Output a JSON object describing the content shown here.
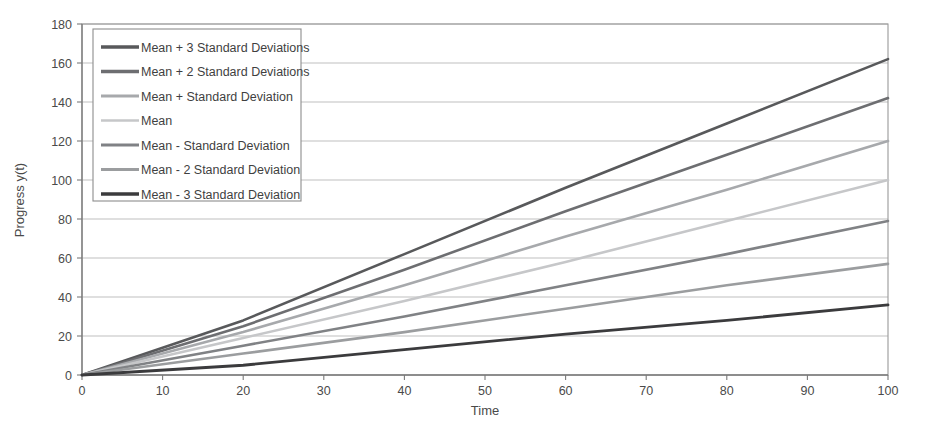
{
  "chart_data": {
    "type": "line",
    "title": "",
    "subtitle": "",
    "xlabel": "Time",
    "ylabel": "Progress y(t)",
    "xlim": [
      0,
      100
    ],
    "ylim": [
      0,
      180
    ],
    "xticks": [
      0,
      10,
      20,
      30,
      40,
      50,
      60,
      70,
      80,
      90,
      100
    ],
    "yticks": [
      0,
      20,
      40,
      60,
      80,
      100,
      120,
      140,
      160,
      180
    ],
    "grid": "horizontal",
    "legend_position": "upper-left-inside",
    "x": [
      0,
      20,
      40,
      60,
      80,
      100
    ],
    "series": [
      {
        "name": "Mean + 3 Standard Deviations",
        "color": "#58595b",
        "width": 2.6,
        "values": [
          0,
          28,
          62,
          96,
          129,
          162
        ]
      },
      {
        "name": "Mean + 2 Standard Deviations",
        "color": "#6d6e71",
        "width": 2.6,
        "values": [
          0,
          25,
          54,
          84,
          113,
          142
        ]
      },
      {
        "name": "Mean + Standard Deviation",
        "color": "#a7a9ac",
        "width": 2.6,
        "values": [
          0,
          22,
          46,
          71,
          95,
          120
        ]
      },
      {
        "name": "Mean",
        "color": "#c6c7c9",
        "width": 2.6,
        "values": [
          0,
          19,
          38,
          58,
          79,
          100
        ]
      },
      {
        "name": "Mean - Standard Deviation",
        "color": "#808285",
        "width": 2.6,
        "values": [
          0,
          15,
          30,
          46,
          62,
          79
        ]
      },
      {
        "name": "Mean - 2 Standard Deviation",
        "color": "#9b9d9f",
        "width": 2.6,
        "values": [
          0,
          11,
          22,
          34,
          46,
          57
        ]
      },
      {
        "name": "Mean - 3 Standard Deviation",
        "color": "#3b3b3d",
        "width": 2.8,
        "values": [
          0,
          5,
          13,
          21,
          28,
          36
        ]
      }
    ]
  },
  "legend": {
    "items": [
      {
        "label": "Mean + 3 Standard Deviations",
        "color": "#58595b",
        "width": 3.4
      },
      {
        "label": "Mean + 2 Standard Deviations",
        "color": "#6d6e71",
        "width": 3.4
      },
      {
        "label": "Mean + Standard Deviation",
        "color": "#a7a9ac",
        "width": 3.0
      },
      {
        "label": "Mean",
        "color": "#c6c7c9",
        "width": 2.6
      },
      {
        "label": "Mean - Standard Deviation",
        "color": "#808285",
        "width": 3.2
      },
      {
        "label": "Mean - 2 Standard Deviation",
        "color": "#9b9d9f",
        "width": 2.8
      },
      {
        "label": "Mean - 3 Standard Deviation",
        "color": "#3b3b3d",
        "width": 3.6
      }
    ]
  },
  "axes": {
    "x_title": "Time",
    "y_title": "Progress y(t)",
    "x_tick_labels": [
      "0",
      "10",
      "20",
      "30",
      "40",
      "50",
      "60",
      "70",
      "80",
      "90",
      "100"
    ],
    "y_tick_labels": [
      "0",
      "20",
      "40",
      "60",
      "80",
      "100",
      "120",
      "140",
      "160",
      "180"
    ]
  },
  "colors": {
    "grid": "#b8b8b8",
    "frame": "#9a9a9a",
    "axis": "#7a7a7a",
    "text": "#4a4a4a",
    "background": "#ffffff"
  }
}
